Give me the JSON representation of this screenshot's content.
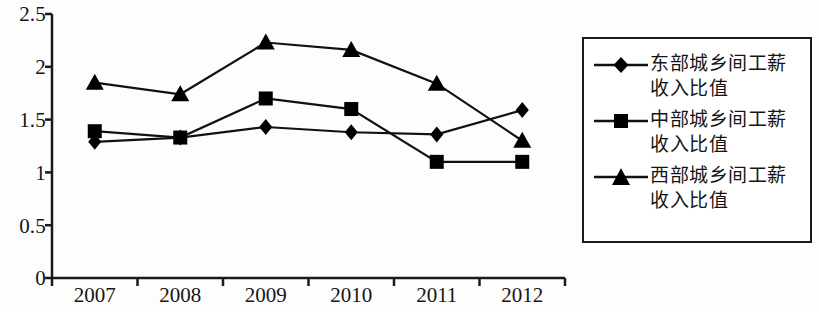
{
  "chart_data": {
    "type": "line",
    "title": "",
    "subtitle": "",
    "xlabel": "",
    "ylabel": "",
    "categories": [
      "2007",
      "2008",
      "2009",
      "2010",
      "2011",
      "2012"
    ],
    "ylim": [
      0,
      2.5
    ],
    "yticks": [
      "0",
      "0.5",
      "1",
      "1.5",
      "2",
      "2.5"
    ],
    "ytick_values": [
      0,
      0.5,
      1,
      1.5,
      2,
      2.5
    ],
    "grid": false,
    "legend_position": "right",
    "series": [
      {
        "name": "东部城乡间工薪收入比值",
        "marker": "diamond",
        "values": [
          1.29,
          1.33,
          1.43,
          1.38,
          1.36,
          1.59
        ]
      },
      {
        "name": "中部城乡间工薪收入比值",
        "marker": "square",
        "values": [
          1.39,
          1.33,
          1.7,
          1.6,
          1.1,
          1.1
        ]
      },
      {
        "name": "西部城乡间工薪收入比值",
        "marker": "triangle",
        "values": [
          1.85,
          1.74,
          2.23,
          2.16,
          1.84,
          1.3
        ]
      }
    ]
  },
  "colors": {
    "line": "#111111",
    "marker": "#000000",
    "axis": "#1a1a1a",
    "background": "#fdfdfd",
    "legend_border": "#1a1a1a"
  },
  "legend": {
    "entries": [
      {
        "label": "东部城乡间工薪收入比值",
        "marker": "diamond-marker-icon"
      },
      {
        "label": "中部城乡间工薪收入比值",
        "marker": "square-marker-icon"
      },
      {
        "label": "西部城乡间工薪收入比值",
        "marker": "triangle-marker-icon"
      }
    ]
  },
  "axes": {
    "y_labels": [
      "2.5",
      "2",
      "1.5",
      "1",
      "0.5",
      "0"
    ],
    "x_labels": [
      "2007",
      "2008",
      "2009",
      "2010",
      "2011",
      "2012"
    ]
  }
}
